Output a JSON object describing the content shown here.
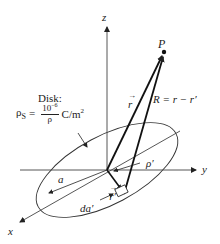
{
  "figure": {
    "axes": {
      "x_label": "x",
      "y_label": "y",
      "z_label": "z"
    },
    "point": {
      "label": "P"
    },
    "disk": {
      "title": "Disk:",
      "density_symbol": "ρ",
      "density_subscript": "S",
      "equals": "=",
      "numerator": "10",
      "numerator_exp": "−6",
      "denominator": "ρ",
      "units": "C/m",
      "units_exp": "2"
    },
    "labels": {
      "r": "r",
      "R_eq": "R = r − r′",
      "R": "R",
      "r_prime": "r′",
      "rho_prime": "ρ′",
      "radius": "a",
      "area_element": "da′"
    },
    "colors": {
      "line": "#222222",
      "axis": "#444444",
      "background": "#ffffff"
    }
  }
}
